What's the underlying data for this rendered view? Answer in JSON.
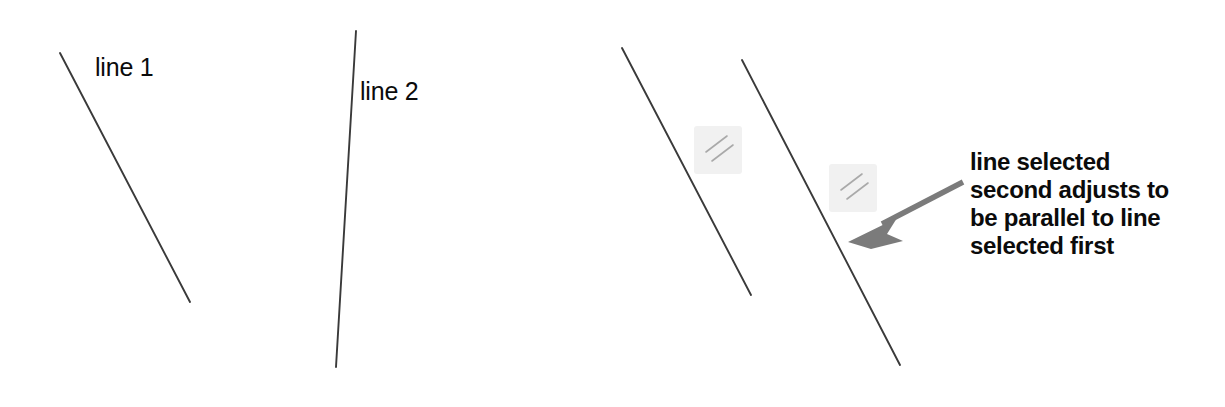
{
  "canvas": {
    "width": 1225,
    "height": 407,
    "background": "#ffffff"
  },
  "colors": {
    "line_stroke": "#3a3a3a",
    "arrow": "#7b7b7b",
    "marker_box": "#f1f1f1",
    "marker_tick": "#a9a9a9",
    "text": "#0b0b0b"
  },
  "labels": {
    "line_1": "line 1",
    "line_2": "line 2"
  },
  "callout": {
    "line_1": "line selected",
    "line_2": "second adjusts to",
    "line_3": "be parallel to line",
    "line_4": "selected first",
    "full_text": "line selected second adjusts to be parallel to line selected first"
  },
  "geometry": {
    "line_1": {
      "x1": 60,
      "y1": 53,
      "x2": 190,
      "y2": 302
    },
    "line_2": {
      "x1": 356,
      "y1": 31,
      "x2": 336,
      "y2": 367
    },
    "line_3": {
      "x1": 622,
      "y1": 48,
      "x2": 751,
      "y2": 295
    },
    "line_4": {
      "x1": 742,
      "y1": 60,
      "x2": 900,
      "y2": 365
    },
    "arrow": {
      "x1": 963,
      "y1": 182,
      "x2": 848,
      "y2": 242
    },
    "marker_1": {
      "cx": 718,
      "cy": 150
    },
    "marker_2": {
      "cx": 853,
      "cy": 188
    }
  },
  "icons": {
    "parallel_marker": "parallel-marker-icon",
    "callout_arrow": "arrow-pointer-icon"
  }
}
